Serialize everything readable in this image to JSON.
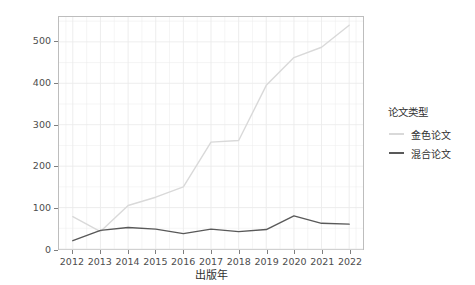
{
  "chart_data": {
    "type": "line",
    "title": "",
    "xlabel": "出版年",
    "ylabel": "APC费用（万元）",
    "x": [
      2012,
      2013,
      2014,
      2015,
      2016,
      2017,
      2018,
      2019,
      2020,
      2021,
      2022
    ],
    "xtick_labels": [
      "2012",
      "2013",
      "2014",
      "2015",
      "2016",
      "2017",
      "2018",
      "2019",
      "2020",
      "2021",
      "2022"
    ],
    "ytick_labels": [
      "0",
      "100",
      "200",
      "300",
      "400",
      "500"
    ],
    "yticks": [
      0,
      100,
      200,
      300,
      400,
      500
    ],
    "xlim": [
      2011.5,
      2022.5
    ],
    "ylim": [
      0,
      560
    ],
    "grid": true,
    "legend": {
      "title": "论文类型",
      "position": "right"
    },
    "series": [
      {
        "name": "金色论文",
        "color": "#d9d9d9",
        "values": [
          78,
          42,
          105,
          125,
          150,
          258,
          262,
          395,
          462,
          487,
          540
        ]
      },
      {
        "name": "混合论文",
        "color": "#595959",
        "values": [
          20,
          45,
          52,
          48,
          37,
          48,
          42,
          47,
          80,
          62,
          60
        ]
      }
    ]
  },
  "panel": {
    "background": "#ffffff",
    "border_color": "#bdbdbd",
    "grid_color": "#ebebeb"
  }
}
